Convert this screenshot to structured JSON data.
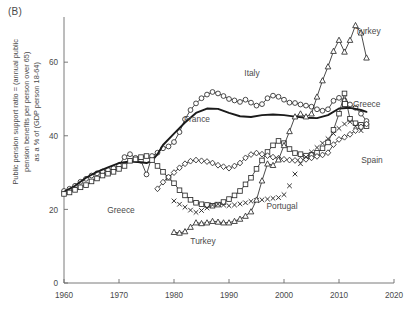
{
  "panel": {
    "label": "(B)"
  },
  "axes": {
    "ylabel": "Public pension support ratio = (annual public\npension benefits per person over 65)\nas a % of (GDP person 18-64)",
    "xlabel": "",
    "x_ticks": [
      1960,
      1970,
      1980,
      1990,
      2000,
      2010,
      2020
    ],
    "y_ticks": [
      0,
      20,
      40,
      60
    ],
    "xlim": [
      1960,
      2020
    ],
    "ylim": [
      0,
      72
    ]
  },
  "legend": {
    "entries": [
      {
        "name": "Greece",
        "marker": "square",
        "label": "Greece"
      }
    ]
  },
  "annotations": [
    {
      "name": "italy-label",
      "text": "Italy",
      "x": 252,
      "y": 76
    },
    {
      "name": "france-label",
      "text": "France",
      "x": 197,
      "y": 122
    },
    {
      "name": "turkey-top-label",
      "text": "Turkey",
      "x": 368,
      "y": 34
    },
    {
      "name": "greece-left-label",
      "text": "Greece",
      "x": 121,
      "y": 213
    },
    {
      "name": "turkey-low-label",
      "text": "Turkey",
      "x": 203,
      "y": 244
    },
    {
      "name": "portugal-label",
      "text": "Portugal",
      "x": 282,
      "y": 209
    },
    {
      "name": "spain-label",
      "text": "Spain",
      "x": 372,
      "y": 163
    }
  ],
  "chart_data": {
    "type": "line",
    "title": "",
    "xlabel": "",
    "ylabel": "Public pension support ratio = (annual public pension benefits per person over 65) as a % of (GDP person 18-64)",
    "xlim": [
      1960,
      2020
    ],
    "ylim": [
      0,
      72
    ],
    "grid": false,
    "legend_position": "right-inside",
    "series": [
      {
        "name": "Italy",
        "marker": "circle",
        "line": "thin",
        "x": [
          1960,
          1961,
          1962,
          1963,
          1964,
          1965,
          1966,
          1967,
          1968,
          1969,
          1970,
          1971,
          1972,
          1973,
          1974,
          1975,
          1976,
          1977,
          1978,
          1979,
          1980,
          1981,
          1982,
          1983,
          1984,
          1985,
          1986,
          1987,
          1988,
          1989,
          1990,
          1991,
          1992,
          1993,
          1994,
          1995,
          1996,
          1997,
          1998,
          1999,
          2000,
          2001,
          2002,
          2003,
          2004,
          2005,
          2006,
          2007,
          2008,
          2009,
          2010,
          2011,
          2012,
          2013,
          2014,
          2015
        ],
        "y": [
          25.0,
          25.6,
          26.4,
          27.5,
          28.3,
          29.2,
          29.8,
          30.3,
          30.7,
          31.2,
          32.0,
          34.2,
          35.0,
          34.0,
          33.2,
          29.5,
          34.5,
          35.4,
          36.6,
          37.1,
          38.3,
          41.0,
          44.5,
          47.0,
          48.8,
          50.2,
          51.2,
          51.9,
          51.5,
          50.8,
          50.0,
          49.6,
          49.2,
          49.8,
          49.0,
          48.2,
          48.6,
          50.2,
          50.9,
          50.6,
          49.8,
          49.0,
          48.9,
          48.5,
          48.2,
          47.9,
          47.2,
          46.8,
          47.2,
          49.5,
          50.3,
          49.6,
          48.5,
          47.6,
          46.0,
          44.0
        ]
      },
      {
        "name": "France",
        "marker": "none",
        "line": "thick",
        "x": [
          1960,
          1962,
          1964,
          1966,
          1968,
          1970,
          1972,
          1974,
          1975,
          1976,
          1977,
          1978,
          1980,
          1982,
          1984,
          1986,
          1988,
          1990,
          1992,
          1994,
          1996,
          1998,
          2000,
          2002,
          2004,
          2006,
          2008,
          2010,
          2012,
          2014,
          2015
        ],
        "y": [
          24.8,
          26.4,
          28.6,
          30.2,
          31.4,
          32.6,
          33.0,
          32.8,
          32.6,
          33.2,
          35.0,
          37.5,
          40.6,
          43.6,
          46.2,
          47.4,
          47.3,
          46.2,
          45.3,
          45.1,
          45.6,
          45.8,
          45.6,
          45.2,
          44.9,
          44.8,
          45.6,
          47.4,
          47.6,
          47.0,
          46.5
        ]
      },
      {
        "name": "Greece",
        "marker": "square",
        "line": "thin",
        "x": [
          1960,
          1961,
          1962,
          1963,
          1964,
          1965,
          1966,
          1967,
          1968,
          1969,
          1970,
          1971,
          1972,
          1973,
          1974,
          1975,
          1976,
          1977,
          1978,
          1979,
          1980,
          1981,
          1982,
          1983,
          1984,
          1985,
          1986,
          1987,
          1988,
          1989,
          1990,
          1991,
          1992,
          1993,
          1994,
          1995,
          1996,
          1997,
          1998,
          1999,
          2000,
          2001,
          2002,
          2003,
          2004,
          2005,
          2006,
          2007,
          2008,
          2009,
          2010,
          2011,
          2012,
          2013,
          2014,
          2015
        ],
        "y": [
          24.2,
          24.6,
          25.3,
          26.0,
          26.6,
          27.6,
          28.4,
          29.2,
          29.7,
          30.2,
          31.0,
          31.8,
          33.2,
          33.6,
          34.2,
          34.5,
          33.4,
          31.8,
          30.2,
          28.6,
          27.1,
          25.2,
          23.8,
          22.6,
          21.8,
          21.4,
          21.2,
          21.0,
          21.3,
          22.0,
          22.8,
          23.8,
          25.0,
          26.8,
          28.6,
          31.0,
          33.3,
          35.6,
          37.4,
          38.6,
          38.0,
          36.4,
          35.3,
          35.0,
          34.6,
          34.8,
          35.4,
          36.6,
          38.2,
          41.6,
          46.0,
          51.5,
          44.6,
          43.4,
          43.0,
          42.6
        ]
      },
      {
        "name": "Spain",
        "marker": "diamond",
        "line": "thin",
        "x": [
          1977,
          1978,
          1979,
          1980,
          1981,
          1982,
          1983,
          1984,
          1985,
          1986,
          1987,
          1988,
          1989,
          1990,
          1991,
          1992,
          1993,
          1994,
          1995,
          1996,
          1997,
          1998,
          1999,
          2000,
          2001,
          2002,
          2003,
          2004,
          2005,
          2006,
          2007,
          2008,
          2009,
          2010,
          2011,
          2012,
          2013,
          2014,
          2015
        ],
        "y": [
          25.6,
          27.4,
          28.8,
          30.0,
          31.3,
          32.4,
          33.1,
          33.4,
          33.2,
          33.0,
          32.6,
          32.0,
          31.6,
          31.2,
          31.8,
          32.6,
          34.0,
          34.9,
          35.3,
          35.0,
          34.6,
          34.2,
          33.9,
          33.6,
          33.4,
          33.3,
          33.4,
          33.6,
          34.0,
          34.4,
          34.8,
          35.4,
          37.6,
          39.0,
          39.6,
          40.4,
          41.4,
          42.4,
          43.2
        ]
      },
      {
        "name": "Portugal",
        "marker": "cross",
        "line": "none",
        "x": [
          1980,
          1981,
          1982,
          1983,
          1984,
          1985,
          1986,
          1987,
          1988,
          1989,
          1990,
          1991,
          1992,
          1993,
          1994,
          1995,
          1996,
          1997,
          1998,
          1999,
          2000,
          2001,
          2002,
          2003,
          2004,
          2005,
          2006,
          2007,
          2008,
          2009,
          2010,
          2011,
          2012,
          2013,
          2014
        ],
        "y": [
          22.3,
          21.4,
          20.6,
          19.8,
          19.2,
          19.7,
          20.4,
          21.2,
          21.4,
          21.2,
          21.0,
          21.2,
          21.5,
          21.8,
          22.2,
          22.4,
          22.6,
          22.8,
          23.0,
          23.2,
          24.0,
          26.4,
          29.6,
          32.4,
          34.2,
          35.6,
          36.8,
          38.0,
          39.2,
          40.6,
          42.0,
          43.2,
          43.8,
          42.6,
          41.4
        ]
      },
      {
        "name": "Turkey",
        "marker": "triangle",
        "line": "thin",
        "x": [
          1980,
          1981,
          1982,
          1983,
          1984,
          1985,
          1986,
          1987,
          1988,
          1989,
          1990,
          1991,
          1992,
          1993,
          1994,
          1995,
          1996,
          1997,
          1998,
          1999,
          2000,
          2001,
          2002,
          2003,
          2004,
          2005,
          2006,
          2007,
          2008,
          2009,
          2010,
          2011,
          2012,
          2013,
          2014,
          2015
        ],
        "y": [
          13.8,
          13.6,
          14.0,
          15.2,
          16.4,
          16.2,
          16.4,
          16.8,
          16.6,
          16.4,
          16.4,
          16.8,
          17.4,
          18.2,
          19.4,
          22.6,
          27.8,
          32.4,
          32.0,
          33.5,
          37.4,
          41.2,
          45.2,
          46.0,
          45.2,
          46.0,
          50.6,
          55.0,
          58.8,
          63.0,
          66.0,
          62.8,
          66.0,
          70.0,
          68.0,
          61.2
        ]
      }
    ]
  }
}
